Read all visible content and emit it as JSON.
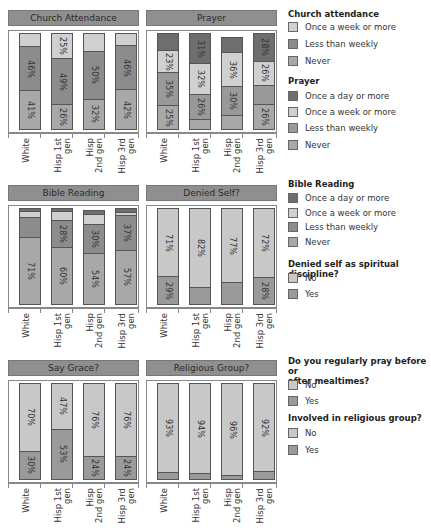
{
  "colors": {
    "title_bar": "#8f8f8f",
    "once_a_day": "#6e6e6e",
    "once_a_week": "#d0d0d0",
    "less_than_weekly": "#8c8c8c",
    "never": "#a8a8a8",
    "prayer_less_than_weekly": "#999999",
    "no": "#c8c8c8",
    "yes": "#9a9a9a"
  },
  "categories": [
    "White",
    "Hisp 1st\ngen",
    "Hisp\n2nd gen",
    "Hisp 3rd\ngen"
  ],
  "chart_data": [
    {
      "type": "bar",
      "stacked": true,
      "title": "Church Attendance",
      "categories": [
        "White",
        "Hisp 1st gen",
        "Hisp 2nd gen",
        "Hisp 3rd gen"
      ],
      "series": [
        {
          "name": "Never",
          "values": [
            41,
            26,
            32,
            42
          ],
          "labels": [
            "41%",
            "26%",
            "32%",
            "42%"
          ]
        },
        {
          "name": "Less than weekly",
          "values": [
            46,
            49,
            50,
            46
          ],
          "labels": [
            "46%",
            "49%",
            "50%",
            "46%"
          ]
        },
        {
          "name": "Once a week or more",
          "values": [
            13,
            25,
            18,
            12
          ],
          "labels": [
            "",
            "25%",
            "",
            ""
          ]
        }
      ],
      "ylim": [
        0,
        100
      ]
    },
    {
      "type": "bar",
      "stacked": true,
      "title": "Prayer",
      "categories": [
        "White",
        "Hisp 1st gen",
        "Hisp 2nd gen",
        "Hisp 3rd gen"
      ],
      "series": [
        {
          "name": "Never",
          "values": [
            25,
            11,
            15,
            26
          ],
          "labels": [
            "25%",
            "",
            "",
            "26%"
          ]
        },
        {
          "name": "Less than weekly",
          "values": [
            35,
            26,
            30,
            20
          ],
          "labels": [
            "35%",
            "26%",
            "30%",
            ""
          ]
        },
        {
          "name": "Once a week or more",
          "values": [
            23,
            32,
            36,
            26
          ],
          "labels": [
            "23%",
            "32%",
            "36%",
            "26%"
          ]
        },
        {
          "name": "Once a day or more",
          "values": [
            17,
            31,
            15,
            28
          ],
          "labels": [
            "",
            "31%",
            "",
            "28%"
          ]
        }
      ],
      "ylim": [
        0,
        100
      ]
    },
    {
      "type": "bar",
      "stacked": true,
      "title": "Bible Reading",
      "categories": [
        "White",
        "Hisp 1st gen",
        "Hisp 2nd gen",
        "Hisp 3rd gen"
      ],
      "series": [
        {
          "name": "Never",
          "values": [
            71,
            60,
            54,
            57
          ],
          "labels": [
            "71%",
            "60%",
            "54%",
            "57%"
          ]
        },
        {
          "name": "Less than weekly",
          "values": [
            21,
            28,
            30,
            37
          ],
          "labels": [
            "",
            "28%",
            "30%",
            "37%"
          ]
        },
        {
          "name": "Once a week or more",
          "values": [
            6,
            10,
            11,
            3
          ],
          "labels": [
            "",
            "",
            "",
            ""
          ]
        },
        {
          "name": "Once a day or more",
          "values": [
            2,
            2,
            3,
            3
          ],
          "labels": [
            "",
            "",
            "",
            ""
          ]
        }
      ],
      "ylim": [
        0,
        100
      ]
    },
    {
      "type": "bar",
      "stacked": true,
      "title": "Denied Self?",
      "categories": [
        "White",
        "Hisp 1st gen",
        "Hisp 2nd gen",
        "Hisp 3rd gen"
      ],
      "series": [
        {
          "name": "Yes",
          "values": [
            29,
            18,
            23,
            28
          ],
          "labels": [
            "29%",
            "",
            "",
            "28%"
          ]
        },
        {
          "name": "No",
          "values": [
            71,
            82,
            77,
            72
          ],
          "labels": [
            "71%",
            "82%",
            "77%",
            "72%"
          ]
        }
      ],
      "ylim": [
        0,
        100
      ]
    },
    {
      "type": "bar",
      "stacked": true,
      "title": "Say Grace?",
      "categories": [
        "White",
        "Hisp 1st gen",
        "Hisp 2nd gen",
        "Hisp 3rd gen"
      ],
      "series": [
        {
          "name": "Yes",
          "values": [
            30,
            53,
            24,
            24
          ],
          "labels": [
            "30%",
            "53%",
            "24%",
            "24%"
          ]
        },
        {
          "name": "No",
          "values": [
            70,
            47,
            76,
            76
          ],
          "labels": [
            "70%",
            "47%",
            "76%",
            "76%"
          ]
        }
      ],
      "ylim": [
        0,
        100
      ]
    },
    {
      "type": "bar",
      "stacked": true,
      "title": "Religious Group?",
      "categories": [
        "White",
        "Hisp 1st gen",
        "Hisp 2nd gen",
        "Hisp 3rd gen"
      ],
      "series": [
        {
          "name": "Yes",
          "values": [
            7,
            6,
            4,
            8
          ],
          "labels": [
            "",
            "",
            "",
            ""
          ]
        },
        {
          "name": "No",
          "values": [
            93,
            94,
            96,
            92
          ],
          "labels": [
            "93%",
            "94%",
            "96%",
            "92%"
          ]
        }
      ],
      "ylim": [
        0,
        100
      ]
    }
  ],
  "legend": {
    "church": {
      "title": "Church attendance",
      "items": [
        "Once a week or more",
        "Less than weekly",
        "Never"
      ]
    },
    "prayer": {
      "title": "Prayer",
      "items": [
        "Once a day or more",
        "Once a week or more",
        "Less than weekly",
        "Never"
      ]
    },
    "bible": {
      "title": "Bible Reading",
      "items": [
        "Once a day or more",
        "Once a week or more",
        "Less than weekly",
        "Never"
      ]
    },
    "denied": {
      "title": "Denied self as spiritual discipline?",
      "items": [
        "No",
        "Yes"
      ]
    },
    "grace": {
      "title_line1": "Do you regularly pray before or",
      "title_line2": "after mealtimes?",
      "items": [
        "No",
        "Yes"
      ]
    },
    "group": {
      "title": "Involved in religious group?",
      "items": [
        "No",
        "Yes"
      ]
    }
  }
}
